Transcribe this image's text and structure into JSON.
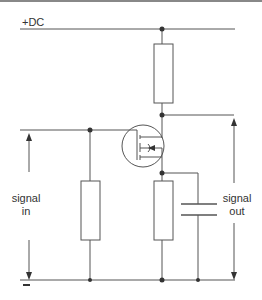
{
  "diagram": {
    "type": "circuit",
    "supply_label": "+DC",
    "input_label_line1": "signal",
    "input_label_line2": "in",
    "output_label_line1": "signal",
    "output_label_line2": "out",
    "ground_marker": "−",
    "colors": {
      "line": "#555555",
      "background": "#ffffff",
      "text": "#333333"
    },
    "components": [
      {
        "id": "R_drain",
        "type": "resistor",
        "position": "between +DC and drain"
      },
      {
        "id": "R_gate",
        "type": "resistor",
        "position": "gate to ground"
      },
      {
        "id": "R_source",
        "type": "resistor",
        "position": "source to ground"
      },
      {
        "id": "C_out",
        "type": "capacitor",
        "position": "source to ground"
      },
      {
        "id": "Q1",
        "type": "MOSFET",
        "position": "center"
      }
    ]
  }
}
